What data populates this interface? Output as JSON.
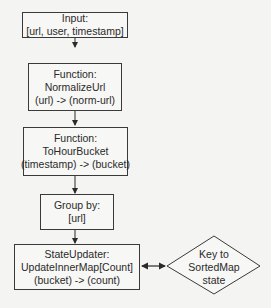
{
  "diagram": {
    "type": "flowchart",
    "nodes": [
      {
        "id": "input",
        "shape": "rect",
        "lines": [
          "Input:",
          "[url, user, timestamp]"
        ]
      },
      {
        "id": "normalize-url",
        "shape": "rect",
        "lines": [
          "Function:",
          "NormalizeUrl",
          "(url) -> (norm-url)"
        ]
      },
      {
        "id": "to-hour-bucket",
        "shape": "rect",
        "lines": [
          "Function:",
          "ToHourBucket",
          "(timestamp) -> (bucket)"
        ]
      },
      {
        "id": "group-by",
        "shape": "rect",
        "lines": [
          "Group by:",
          "[url]"
        ]
      },
      {
        "id": "state-updater",
        "shape": "rect",
        "lines": [
          "StateUpdater:",
          "UpdateInnerMap[Count]",
          "(bucket) -> (count)"
        ]
      },
      {
        "id": "sorted-map-state",
        "shape": "diamond",
        "lines": [
          "Key to",
          "SortedMap",
          "state"
        ]
      }
    ],
    "edges": [
      {
        "from": "input",
        "to": "normalize-url",
        "direction": "forward"
      },
      {
        "from": "normalize-url",
        "to": "to-hour-bucket",
        "direction": "forward"
      },
      {
        "from": "to-hour-bucket",
        "to": "group-by",
        "direction": "forward"
      },
      {
        "from": "group-by",
        "to": "state-updater",
        "direction": "forward"
      },
      {
        "from": "state-updater",
        "to": "sorted-map-state",
        "direction": "bidirectional"
      }
    ],
    "colors": {
      "stroke": "#3a3a3a",
      "background": "#f4f4f2",
      "text": "#2a2a2a"
    }
  }
}
